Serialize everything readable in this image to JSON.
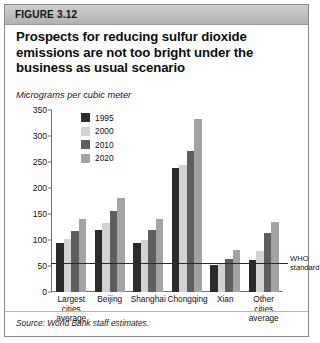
{
  "figure": {
    "number": "FIGURE 3.12",
    "title": "Prospects for reducing sulfur dioxide emissions are not too bright under the business as usual scenario",
    "subtitle": "Micrograms per cubic meter",
    "source": "Source: World Bank staff estimates."
  },
  "chart_data": {
    "type": "bar",
    "title": "Prospects for reducing sulfur dioxide emissions are not too bright under the business as usual scenario",
    "subtitle": "Micrograms per cubic meter",
    "xlabel": "",
    "ylabel": "Micrograms per cubic meter",
    "ylim": [
      0,
      350
    ],
    "yticks": [
      0,
      50,
      100,
      150,
      200,
      250,
      300,
      350
    ],
    "grid": false,
    "legend_position": "top-left-inside",
    "categories": [
      "Largest cities average",
      "Beijing",
      "Shanghai",
      "Chongqing",
      "Xian",
      "Other cities average"
    ],
    "series": [
      {
        "name": "1995",
        "color": "#2b2b2b",
        "values": [
          95,
          120,
          95,
          239,
          51,
          61
        ]
      },
      {
        "name": "2000",
        "color": "#d2d2d2",
        "values": [
          102,
          133,
          100,
          245,
          54,
          79
        ]
      },
      {
        "name": "2010",
        "color": "#5e5e5e",
        "values": [
          118,
          155,
          119,
          271,
          64,
          113
        ]
      },
      {
        "name": "2020",
        "color": "#a3a3a3",
        "values": [
          141,
          180,
          141,
          333,
          80,
          134
        ]
      }
    ],
    "reference_line": {
      "label": "WHO standard",
      "value": 55,
      "color": "#2b2b2b"
    }
  }
}
